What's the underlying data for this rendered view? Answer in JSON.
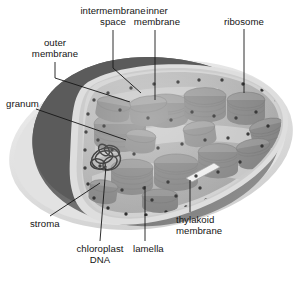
{
  "figure": {
    "subject": "chloroplast",
    "style": "grayscale cut-away schematic diagram",
    "caption_faint": ""
  },
  "labels": [
    {
      "id": "intermembrane-space",
      "text": "intermembrane\nspace",
      "x": 67,
      "y": 6,
      "w": 92,
      "align": "center"
    },
    {
      "id": "inner-membrane",
      "text": "inner\nmembrane",
      "x": 137,
      "y": 6,
      "w": 80,
      "align": "center"
    },
    {
      "id": "ribosome",
      "text": "ribosome",
      "x": 210,
      "y": 17,
      "w": 70,
      "align": "center"
    },
    {
      "id": "outer-membrane",
      "text": "outer\nmembrane",
      "x": 14,
      "y": 38,
      "w": 82,
      "align": "center"
    },
    {
      "id": "granum",
      "text": "granum",
      "x": 6,
      "y": 99,
      "w": 52,
      "align": "left"
    },
    {
      "id": "stroma",
      "text": "stroma",
      "x": 30,
      "y": 219,
      "w": 48,
      "align": "left"
    },
    {
      "id": "chloroplast-dna",
      "text": "chloroplast\nDNA",
      "x": 68,
      "y": 244,
      "w": 66,
      "align": "center"
    },
    {
      "id": "lamella",
      "text": "lamella",
      "x": 131,
      "y": 244,
      "w": 48,
      "align": "left"
    },
    {
      "id": "thylakoid-membrane",
      "text": "thylakoid\nmembrane",
      "x": 176,
      "y": 215,
      "w": 82,
      "align": "left"
    }
  ],
  "colors": {
    "outer_membrane_dark": "#5e5e5e",
    "envelope_light": "#d8d8d8",
    "stroma": "#a9a9a9",
    "granum_face": "#8f8f8f",
    "granum_side": "#7a7a7a",
    "lamella": "#bdbdbd",
    "ribosome_dot": "#1a1a1a",
    "dna_stroke": "#141414",
    "leader_line": "#1a1a1a",
    "background": "#ffffff",
    "text": "#141414"
  },
  "structures": {
    "grana_count": 14,
    "ribosome_count": 58,
    "has_dna_coil": true,
    "has_thylakoid_callout": true
  }
}
